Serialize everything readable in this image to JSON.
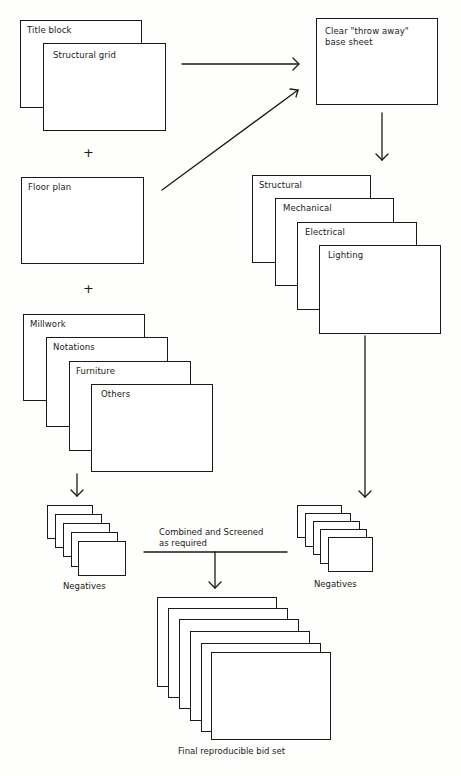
{
  "diagram": {
    "type": "flow",
    "left_column": {
      "group_1": [
        {
          "label": "Title block"
        },
        {
          "label": "Structural grid"
        }
      ],
      "plus_1": "+",
      "group_2": [
        {
          "label": "Floor plan"
        }
      ],
      "plus_2": "+",
      "group_3": [
        {
          "label": "Millwork"
        },
        {
          "label": "Notations"
        },
        {
          "label": "Furniture"
        },
        {
          "label": "Others"
        }
      ]
    },
    "right_column": {
      "base_sheet": {
        "label": "Clear \"throw away\"\nbase sheet"
      },
      "overlays": [
        {
          "label": "Structural"
        },
        {
          "label": "Mechanical"
        },
        {
          "label": "Electrical"
        },
        {
          "label": "Lighting"
        }
      ]
    },
    "negatives_left": {
      "label": "Negatives",
      "sheet_count": 5
    },
    "negatives_right": {
      "label": "Negatives",
      "sheet_count": 5
    },
    "combine_step": {
      "label": "Combined and Screened\nas required"
    },
    "final_set": {
      "label": "Final reproducible bid set",
      "sheet_count": 6
    },
    "edges": [
      {
        "from": "Structural grid",
        "to": "Clear \"throw away\" base sheet"
      },
      {
        "from": "Floor plan",
        "to": "Clear \"throw away\" base sheet"
      },
      {
        "from": "Clear \"throw away\" base sheet",
        "to": "Structural/Mechanical/Electrical/Lighting overlays"
      },
      {
        "from": "Millwork/Notations/Furniture/Others",
        "to": "Negatives (left)"
      },
      {
        "from": "Structural/Mechanical/Electrical/Lighting overlays",
        "to": "Negatives (right)"
      },
      {
        "from": "Negatives (left + right)",
        "to": "Final reproducible bid set",
        "via": "Combined and Screened as required"
      }
    ],
    "colors": {
      "line": "#1a1a1a",
      "background": "#fefefc"
    }
  }
}
